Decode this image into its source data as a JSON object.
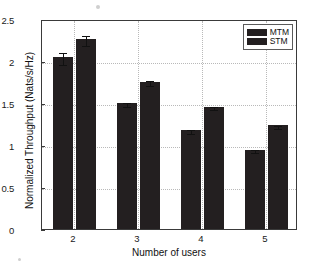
{
  "chart_data": {
    "type": "bar",
    "title": "",
    "xlabel": "Number of users",
    "ylabel": "Normalized Throughput (Nats/s/Hz)",
    "categories": [
      "2",
      "3",
      "4",
      "5"
    ],
    "ylim": [
      0,
      2.5
    ],
    "yticks": [
      "0",
      "0.5",
      "1",
      "1.5",
      "2",
      "2.5"
    ],
    "ytick_values": [
      0,
      0.5,
      1,
      1.5,
      2,
      2.5
    ],
    "grid": true,
    "legend_position": "upper right",
    "series": [
      {
        "name": "MTM",
        "color": "#231f20",
        "values": [
          2.05,
          1.5,
          1.18,
          0.945
        ],
        "errors": [
          0.07,
          0.02,
          0.02,
          0.015
        ]
      },
      {
        "name": "STM",
        "color": "#231f20",
        "values": [
          2.26,
          1.755,
          1.455,
          1.235
        ],
        "errors": [
          0.06,
          0.025,
          0.02,
          0.015
        ]
      }
    ]
  },
  "legend": {
    "items": [
      {
        "label": "MTM"
      },
      {
        "label": "STM"
      }
    ]
  },
  "axes": {
    "xlabel": "Number of users",
    "ylabel": "Normalized Throughput (Nats/s/Hz)",
    "ytick_labels": [
      "2.5",
      "2",
      "1.5",
      "1",
      "0.5",
      "0"
    ],
    "xtick_labels": [
      "2",
      "3",
      "4",
      "5"
    ]
  }
}
